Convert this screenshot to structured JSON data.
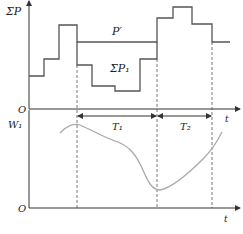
{
  "top_panel": {
    "y_label": "ΣP",
    "origin_label": "O",
    "x_label": "t",
    "curve_labels": {
      "p_prime": "P′",
      "sum_p1": "ΣP₁"
    },
    "step_total_points": [
      [
        29,
        76
      ],
      [
        44,
        76
      ],
      [
        44,
        59
      ],
      [
        59,
        59
      ],
      [
        59,
        25
      ],
      [
        77,
        25
      ],
      [
        77,
        42
      ],
      [
        157,
        42
      ],
      [
        157,
        18
      ],
      [
        173,
        18
      ],
      [
        173,
        7
      ],
      [
        192,
        7
      ],
      [
        192,
        24
      ],
      [
        212,
        24
      ],
      [
        212,
        42
      ],
      [
        230,
        42
      ]
    ],
    "step_p1_points": [
      [
        77,
        42
      ],
      [
        77,
        65
      ],
      [
        92,
        65
      ],
      [
        92,
        86
      ],
      [
        115,
        86
      ],
      [
        115,
        91
      ],
      [
        140,
        91
      ],
      [
        140,
        59
      ],
      [
        157,
        59
      ],
      [
        157,
        42
      ]
    ]
  },
  "intervals": [
    {
      "label": "T₁",
      "x_start": 77,
      "x_end": 157
    },
    {
      "label": "T₂",
      "x_start": 157,
      "x_end": 212
    }
  ],
  "interval_axis_label": "t",
  "bottom_panel": {
    "y_label": "W₁",
    "origin_label": "O",
    "x_label": "t"
  },
  "colors": {
    "line": "#555555",
    "curve": "#aaaaaa",
    "axis": "#333333"
  }
}
